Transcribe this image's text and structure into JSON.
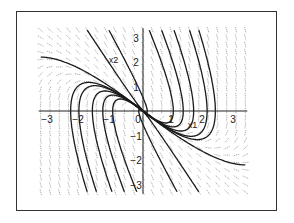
{
  "chart_data": {
    "type": "line",
    "title": "",
    "subtitle": "Phase portrait (direction field with solution trajectories)",
    "xlabel": "x1",
    "ylabel": "x2",
    "xlim": [
      -3.3,
      3.3
    ],
    "ylim": [
      -3.3,
      3.3
    ],
    "x_ticks": [
      -3,
      -2,
      -1,
      0,
      1,
      2,
      3
    ],
    "y_ticks": [
      -3,
      -2,
      -1,
      1,
      2,
      3
    ],
    "x_tick_labels": [
      "-3",
      "-2",
      "-1",
      "0",
      "1",
      "2",
      "3"
    ],
    "y_tick_labels": [
      "-3",
      "-2",
      "-1",
      "1",
      "2",
      "3"
    ],
    "grid": false,
    "legend": null,
    "system": {
      "equations": [
        "x1' = x2",
        "x2' = -2 x1 - 3 x2"
      ],
      "eigenvalues": [
        -1,
        -2
      ],
      "eigenvectors": [
        [
          1,
          -1
        ],
        [
          1,
          -2
        ]
      ],
      "equilibrium": [
        0,
        0
      ],
      "equilibrium_type": "stable node"
    },
    "trajectories": [
      {
        "x0": -3.3,
        "y0": 2.2
      },
      {
        "x0": -1.8,
        "y0": 3.3
      },
      {
        "x0": -1.1,
        "y0": 3.3
      },
      {
        "x0": 0.2,
        "y0": 3.3
      },
      {
        "x0": 0.6,
        "y0": 3.3
      },
      {
        "x0": 1.0,
        "y0": 3.3
      },
      {
        "x0": 1.5,
        "y0": 3.3
      },
      {
        "x0": 1.8,
        "y0": 3.3
      },
      {
        "x0": 3.3,
        "y0": -2.2
      },
      {
        "x0": 1.8,
        "y0": -3.3
      },
      {
        "x0": 1.1,
        "y0": -3.3
      },
      {
        "x0": -0.2,
        "y0": -3.3
      },
      {
        "x0": -0.6,
        "y0": -3.3
      },
      {
        "x0": -1.0,
        "y0": -3.3
      },
      {
        "x0": -1.5,
        "y0": -3.3
      },
      {
        "x0": -1.8,
        "y0": -3.3
      }
    ],
    "annotations": [
      {
        "text": "x2",
        "x": -0.95,
        "y": 1.95
      },
      {
        "text": "x1",
        "x": 1.6,
        "y": -0.7
      }
    ]
  },
  "colors": {
    "frame": "#333333",
    "axes": "#222222",
    "trajectory": "#1a1a1a",
    "field": "#8a8a8a",
    "background": "#ffffff"
  }
}
